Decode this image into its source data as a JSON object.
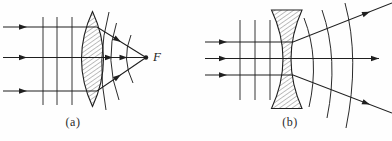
{
  "figure": {
    "type": "optics-lens-wavefront-diagram",
    "background": "#fefefe",
    "line_color": "#1f1f1f",
    "hatch_color": "#4a4a4a",
    "focal_label": "F",
    "panels": [
      {
        "name": "a",
        "caption": "(a)",
        "description": "plane waves converging through biconvex lens to focal point F",
        "lens": {
          "type": "biconvex",
          "path": "M 92.5,11.5 Q 114.5,59 92.5,106.5 Q 70.5,59 92.5,11.5 Z"
        },
        "plane_wavefronts": [
          {
            "x": 43,
            "y1": 17,
            "y2": 105
          },
          {
            "x": 57,
            "y1": 17,
            "y2": 105
          },
          {
            "x": 72,
            "y1": 17,
            "y2": 105
          }
        ],
        "spherical_wavefronts": [
          "M 109,12 Q 96,59 106,110",
          "M 116.5,23 Q 104,59 119,100",
          "M 131,35 Q 121,59 133,83"
        ],
        "rays": [
          {
            "points": [
              [
                3,
                27
              ],
              [
                97,
                27
              ],
              [
                146,
                57.5
              ]
            ],
            "arrows": [
              {
                "tip": [
                  27,
                  27
                ],
                "angle": 0
              },
              {
                "tip": [
                  121,
                  41.9
                ],
                "angle": 31.9
              }
            ]
          },
          {
            "points": [
              [
                3,
                57.5
              ],
              [
                146,
                57.5
              ]
            ],
            "arrows": [
              {
                "tip": [
                  27,
                  57.5
                ],
                "angle": 0
              },
              {
                "tip": [
                  113,
                  57.5
                ],
                "angle": 0
              },
              {
                "tip": [
                  127.5,
                  57.5
                ],
                "angle": 0
              }
            ]
          },
          {
            "points": [
              [
                3,
                91
              ],
              [
                97,
                91
              ],
              [
                146,
                57.5
              ]
            ],
            "arrows": [
              {
                "tip": [
                  27,
                  91
                ],
                "angle": 0
              },
              {
                "tip": [
                  121,
                  74.6
                ],
                "angle": -34.4
              }
            ]
          }
        ],
        "focal_point": {
          "x": 146,
          "y": 57.5,
          "r": 2.2
        }
      },
      {
        "name": "b",
        "caption": "(b)",
        "description": "plane waves diverging through biconcave lens",
        "lens": {
          "type": "biconcave",
          "path": "M 271.5,10 L 302,10 Q 280,59 302,108.5 L 271.5,108.5 Q 294.5,59 271.5,10 Z"
        },
        "plane_wavefronts": [
          {
            "x": 240,
            "y1": 20,
            "y2": 100
          },
          {
            "x": 255,
            "y1": 20,
            "y2": 100
          },
          {
            "x": 270,
            "y1": 20,
            "y2": 100
          }
        ],
        "spherical_wavefronts": [
          "M 304,18 Q 320,59 309,107",
          "M 322,10 Q 339,59 327,118",
          "M 345,3 Q 360,59 346,128"
        ],
        "rays": [
          {
            "points": [
              [
                205,
                42
              ],
              [
                293,
                42
              ],
              [
                392,
                3
              ]
            ],
            "arrows": [
              {
                "tip": [
                  227,
                  42
                ],
                "angle": 0
              },
              {
                "tip": [
                  370,
                  11.7
                ],
                "angle": -21.5
              }
            ]
          },
          {
            "points": [
              [
                205,
                58.5
              ],
              [
                379,
                58.5
              ]
            ],
            "arrows": [
              {
                "tip": [
                  227,
                  58.5
                ],
                "angle": 0
              },
              {
                "tip": [
                  379,
                  58.5
                ],
                "angle": 0
              }
            ]
          },
          {
            "points": [
              [
                205,
                75
              ],
              [
                293,
                75
              ],
              [
                392,
                113
              ]
            ],
            "arrows": [
              {
                "tip": [
                  227,
                  75
                ],
                "angle": 0
              },
              {
                "tip": [
                  370,
                  104.6
                ],
                "angle": 21
              }
            ]
          }
        ]
      }
    ]
  }
}
